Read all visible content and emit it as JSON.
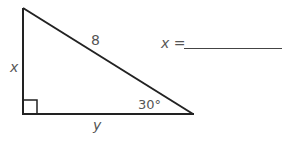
{
  "diagram": {
    "type": "right-triangle",
    "hypotenuse_label": "8",
    "vertical_leg_label": "x",
    "horizontal_leg_label": "y",
    "angle_label": "30°",
    "right_angle_marker": true,
    "stroke_color": "#222222",
    "label_color": "#555555"
  },
  "answer": {
    "prompt": "x =",
    "value": ""
  }
}
